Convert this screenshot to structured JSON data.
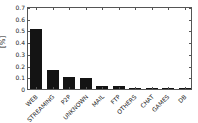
{
  "chart_data": {
    "type": "bar",
    "title": "",
    "xlabel": "",
    "ylabel": "[%]",
    "categories": [
      "WEB",
      "STREAMING",
      "P2P",
      "UNKNOWN",
      "MAIL",
      "FTP",
      "OTHERS",
      "CHAT",
      "GAMES",
      "DB"
    ],
    "values": [
      0.52,
      0.16,
      0.105,
      0.095,
      0.027,
      0.022,
      0.006,
      0.004,
      0.003,
      0.002
    ],
    "ylim": [
      0,
      0.7
    ],
    "yticks": [
      0,
      0.1,
      0.2,
      0.3,
      0.4,
      0.5,
      0.6,
      0.7
    ],
    "ytick_labels": [
      "0",
      "0.1",
      "0.2",
      "0.3",
      "0.4",
      "0.5",
      "0.6",
      "0.7"
    ],
    "bar_color": "#141414",
    "axis_color": "#555555",
    "grid": false,
    "legend": null
  }
}
